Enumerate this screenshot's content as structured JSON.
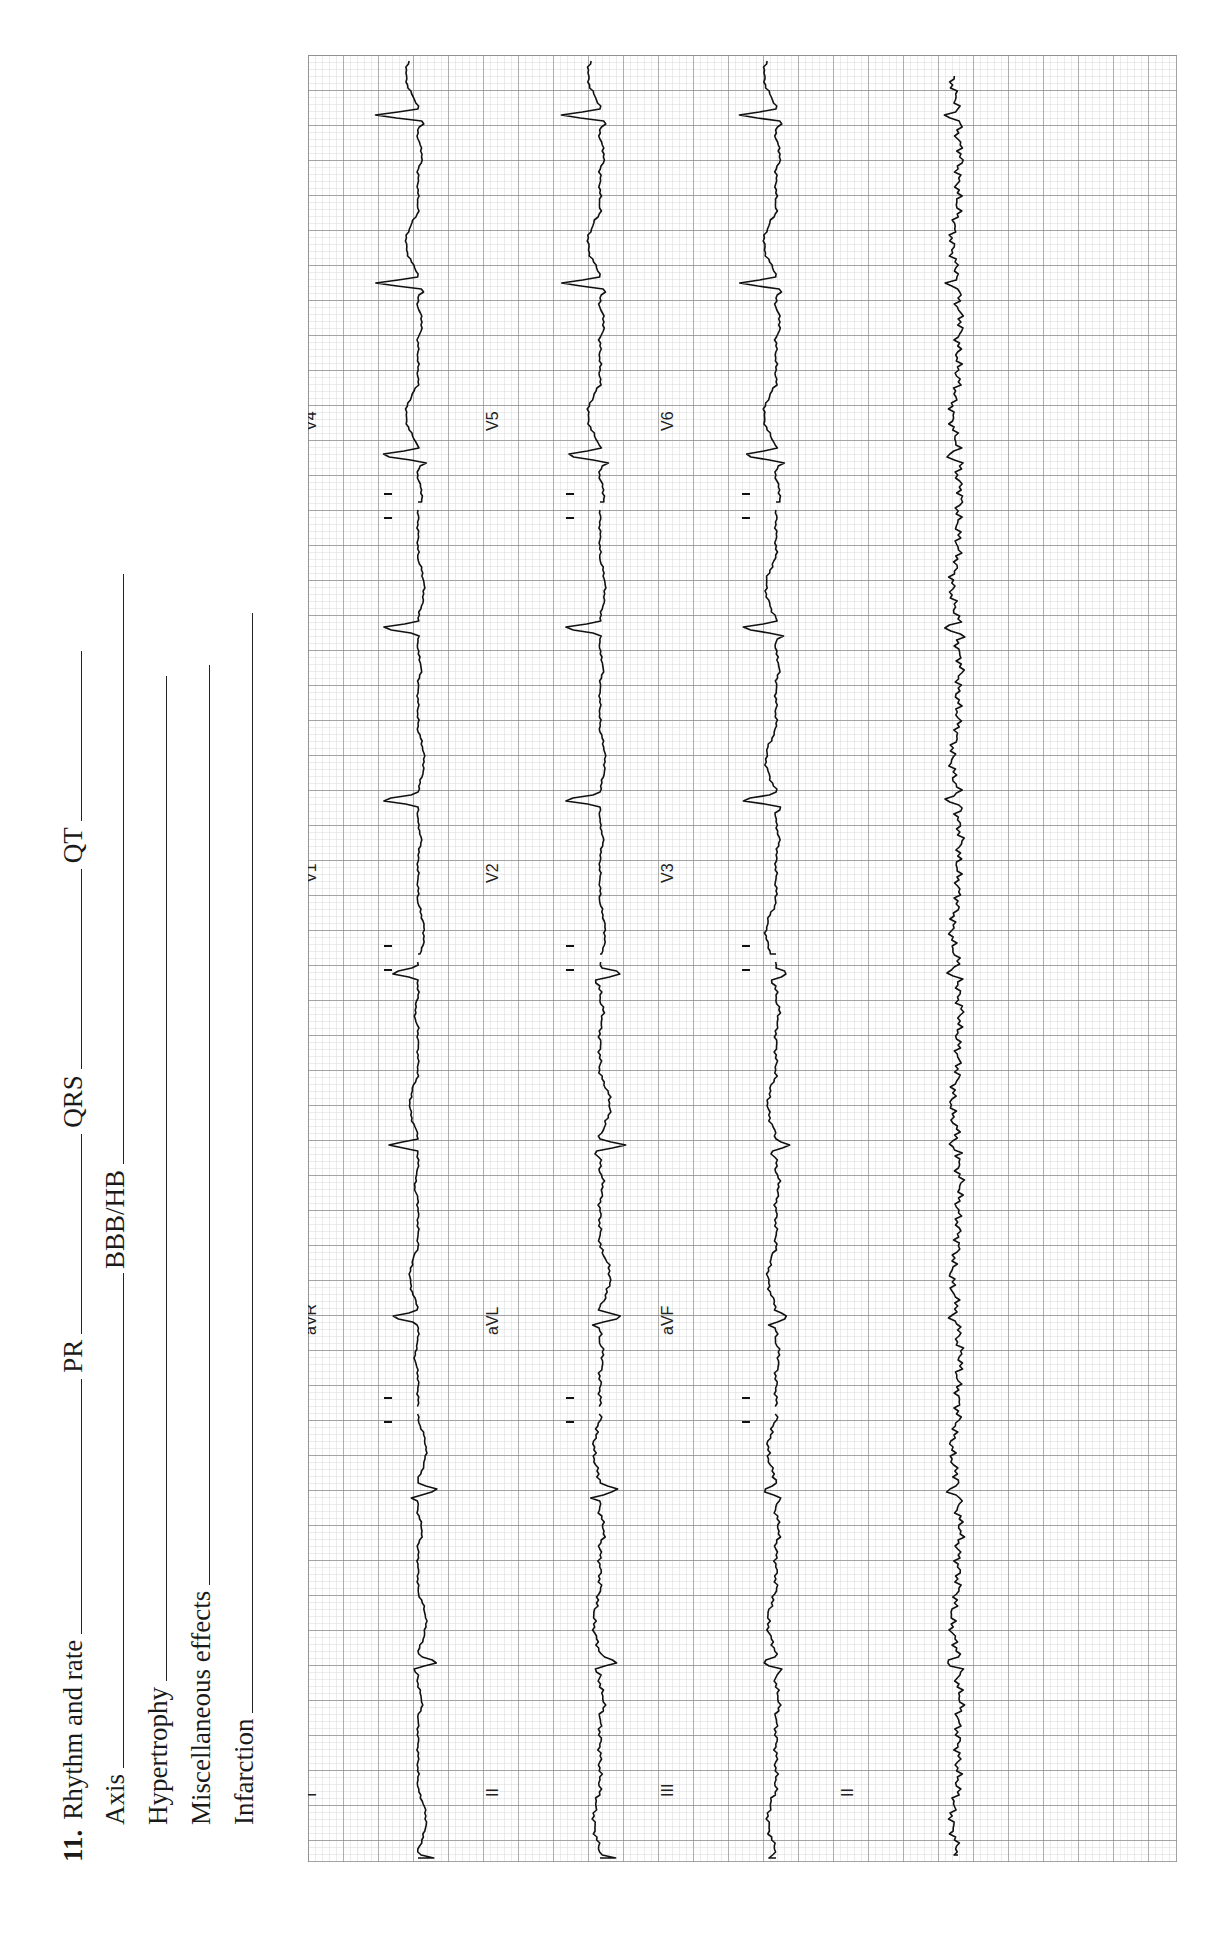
{
  "worksheet": {
    "question_number": "11.",
    "fields": [
      {
        "label": "Rhythm and rate",
        "blank_px": 540
      },
      {
        "label": "PR",
        "blank_px": 200
      },
      {
        "label": "QRS",
        "blank_px": 200
      },
      {
        "label": "QT",
        "blank_px": 170
      }
    ],
    "row2": [
      {
        "label": "Axis",
        "blank_px": 490
      },
      {
        "label": "BBB/HB",
        "blank_px": 590
      }
    ],
    "row3": {
      "label": "Hypertrophy",
      "blank_px": 1070
    },
    "row4": {
      "label": "Miscellaneous effects",
      "blank_px": 920
    },
    "row5": {
      "label": "Infarction",
      "blank_px": 1110
    }
  },
  "ecg": {
    "grid_color_minor": "#c9c9c9",
    "grid_color_major": "#8a8a8a",
    "trace_color": "#111111",
    "small_square_px": 7,
    "large_square_px": 35,
    "rows": [
      {
        "leads": [
          "I",
          "aVR",
          "V1",
          "V4"
        ]
      },
      {
        "leads": [
          "II",
          "aVL",
          "V2",
          "V5"
        ]
      },
      {
        "leads": [
          "III",
          "aVF",
          "V3",
          "V6"
        ]
      },
      {
        "leads": [
          "II"
        ],
        "rhythm_strip": true
      }
    ],
    "lead_labels": {
      "I": "I",
      "II": "II",
      "III": "III",
      "aVR": "aVR",
      "aVL": "aVL",
      "aVF": "aVF",
      "V1": "V1",
      "V2": "V2",
      "V3": "V3",
      "V4": "V4",
      "V5": "V5",
      "V6": "V6",
      "rhythm": "II"
    },
    "rhythm": "regular, approx. 10 beats across 10 s strip",
    "qrs_positions_px": [
      1805,
      1607,
      1435,
      1262,
      1090,
      918,
      745,
      573,
      400,
      228,
      60
    ]
  }
}
